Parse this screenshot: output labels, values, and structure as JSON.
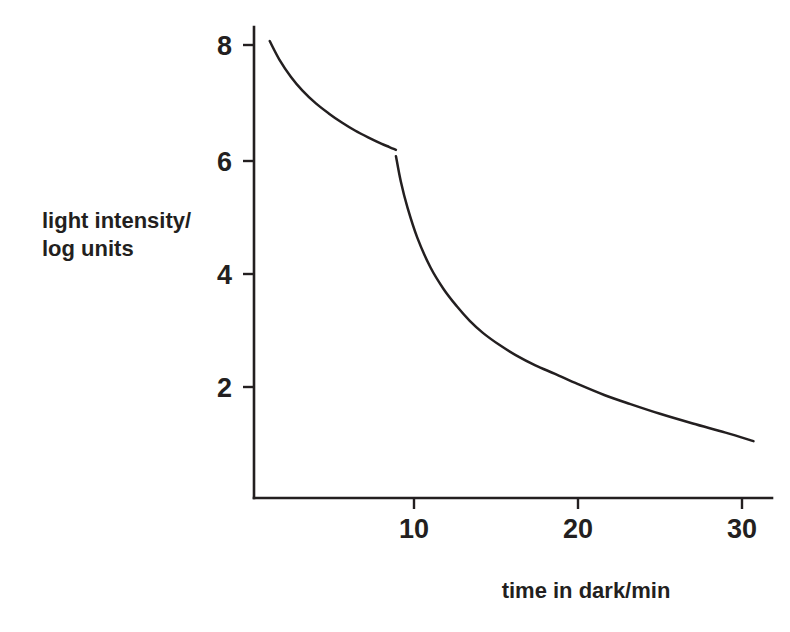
{
  "figure": {
    "background_color": "#ffffff",
    "ink_color": "#231f20"
  },
  "chart_data": {
    "type": "line",
    "title": "",
    "subtitle": "",
    "xlabel": "time in dark/min",
    "ylabel_line1": "light intensity/",
    "ylabel_line2": "log units",
    "ylabel": "light intensity/ log units",
    "xlim": [
      0,
      31.5
    ],
    "ylim": [
      0,
      8.6
    ],
    "xticks": [
      10,
      20,
      30
    ],
    "xtick_labels": [
      "10",
      "20",
      "30"
    ],
    "yticks": [
      2,
      4,
      6,
      8
    ],
    "ytick_labels": [
      "2",
      "4",
      "6",
      "8"
    ],
    "grid": false,
    "legend": false,
    "legend_position": "none",
    "annotations": [],
    "series": [
      {
        "name": "cone branch",
        "x": [
          1.2,
          1.8,
          2.5,
          3.2,
          4.0,
          4.8,
          5.6,
          6.4,
          7.2,
          8.0,
          8.5,
          8.9
        ],
        "y": [
          8.07,
          7.74,
          7.44,
          7.2,
          6.98,
          6.8,
          6.64,
          6.5,
          6.38,
          6.27,
          6.21,
          6.16
        ]
      },
      {
        "name": "rod branch",
        "x": [
          8.9,
          9.2,
          9.6,
          10.2,
          11.0,
          11.8,
          12.6,
          13.4,
          14.2,
          15.2,
          16.2,
          17.4,
          18.6,
          20.0,
          21.6,
          23.2,
          25.0,
          27.0,
          29.0,
          30.7
        ],
        "y": [
          6.05,
          5.6,
          5.15,
          4.62,
          4.1,
          3.72,
          3.42,
          3.16,
          2.95,
          2.74,
          2.56,
          2.38,
          2.23,
          2.05,
          1.86,
          1.7,
          1.53,
          1.36,
          1.2,
          1.05
        ]
      }
    ]
  },
  "axes": {
    "y_axis_name": "y-axis",
    "x_axis_name": "x-axis"
  }
}
